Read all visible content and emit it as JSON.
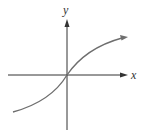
{
  "diagram": {
    "type": "function-graph",
    "x_axis_label": "x",
    "y_axis_label": "y",
    "curve": "increasing S-shaped curve through origin, concave up for x<0, concave down for x>0, arrow at right end",
    "colors": {
      "axes": "#333333",
      "curve": "#6e6e6e",
      "background": "#ffffff"
    }
  }
}
